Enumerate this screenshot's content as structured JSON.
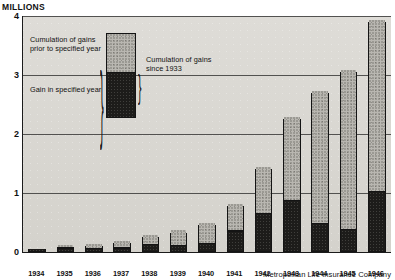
{
  "header": {
    "units_label": "MILLIONS"
  },
  "credit": "Metropolitan Life Insurance Company",
  "legend": {
    "prior_label": "Cumulation of gains prior to specified year",
    "gain_label": "Gain in specified year",
    "since_label": "Cumulation of gains since 1933",
    "brace_glyph": "}",
    "colors": {
      "prior": "#b9b7b1",
      "gain": "#1d1c1a",
      "outline": "#141414",
      "plot_background": "#d9d7d2"
    }
  },
  "chart_data": {
    "type": "bar",
    "title": "Cumulation of gains since 1933",
    "xlabel": "",
    "ylabel": "MILLIONS",
    "ylim": [
      0,
      4
    ],
    "yticks": [
      0,
      1,
      2,
      3,
      4
    ],
    "ytick_labels": [
      "0",
      "1",
      "2",
      "3",
      "4"
    ],
    "grid": true,
    "stacked": true,
    "legend_position": "upper-left-inset",
    "categories": [
      "1934",
      "1935",
      "1936",
      "1937",
      "1938",
      "1939",
      "1940",
      "1941",
      "1942",
      "1943",
      "1944",
      "1945",
      "1946"
    ],
    "series": [
      {
        "name": "Gain in specified year",
        "color": "#1d1c1a",
        "values": [
          0.04,
          0.04,
          0.03,
          0.04,
          0.1,
          0.08,
          0.12,
          0.33,
          0.62,
          0.85,
          0.45,
          0.35,
          1.0
        ]
      },
      {
        "name": "Cumulation of gains prior to specified year",
        "color": "#b9b7b1",
        "values": [
          0.0,
          0.04,
          0.07,
          0.11,
          0.15,
          0.25,
          0.33,
          0.45,
          0.78,
          1.4,
          2.25,
          2.7,
          2.9
        ]
      }
    ],
    "totals": [
      0.04,
      0.08,
      0.1,
      0.15,
      0.25,
      0.33,
      0.45,
      0.78,
      1.4,
      2.25,
      2.7,
      3.05,
      3.9
    ]
  }
}
